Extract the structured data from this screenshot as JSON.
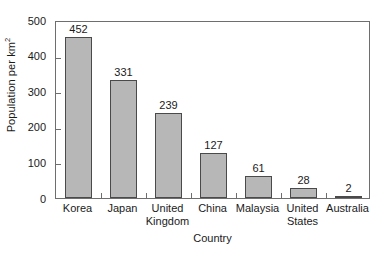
{
  "chart_data": {
    "type": "bar",
    "title": "",
    "subtitle": "",
    "xlabel": "Country",
    "ylabel": "Population per km2",
    "ylabel_base": "Population per km",
    "ylabel_sup": "2",
    "categories": [
      "Korea",
      "Japan",
      "United Kingdom",
      "China",
      "Malaysia",
      "United States",
      "Australia"
    ],
    "category_lines": [
      [
        "Korea"
      ],
      [
        "Japan"
      ],
      [
        "United",
        "Kingdom"
      ],
      [
        "China"
      ],
      [
        "Malaysia"
      ],
      [
        "United",
        "States"
      ],
      [
        "Australia"
      ]
    ],
    "values": [
      452,
      331,
      239,
      127,
      61,
      28,
      2
    ],
    "value_labels": [
      "452",
      "331",
      "239",
      "127",
      "61",
      "28",
      "2"
    ],
    "ylim": [
      0,
      500
    ],
    "yticks": [
      0,
      100,
      200,
      300,
      400,
      500
    ],
    "ytick_labels": [
      "0",
      "100",
      "200",
      "300",
      "400",
      "500"
    ],
    "grid": false,
    "legend": false,
    "legend_position": "none",
    "bar_fill_color": "#b7b7b7",
    "bar_edge_color": "#4a4a4a",
    "axis_color": "#6e6e6e",
    "text_color": "#1a1a1a",
    "background_color": "#ffffff"
  }
}
